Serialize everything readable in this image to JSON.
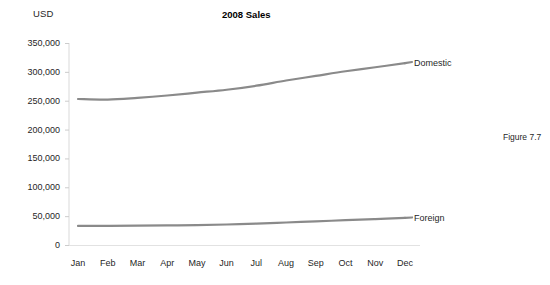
{
  "figure": {
    "caption": "Figure 7.7",
    "title": "2008 Sales",
    "unit_label": "USD"
  },
  "colors": {
    "series_line": "#8a8a8a",
    "axis": "#d9d9d9",
    "tick": "#cccccc",
    "text": "#1f1f1f",
    "background": "#ffffff"
  },
  "chart_data": {
    "type": "line",
    "title": "2008 Sales",
    "xlabel": "",
    "ylabel": "USD",
    "ylim": [
      0,
      350000
    ],
    "yticks": [
      0,
      50000,
      100000,
      150000,
      200000,
      250000,
      300000,
      350000
    ],
    "ytick_labels": [
      "0",
      "50,000",
      "100,000",
      "150,000",
      "200,000",
      "250,000",
      "300,000",
      "350,000"
    ],
    "categories": [
      "Jan",
      "Feb",
      "Mar",
      "Apr",
      "May",
      "Jun",
      "Jul",
      "Aug",
      "Sep",
      "Oct",
      "Nov",
      "Dec"
    ],
    "grid": false,
    "legend_position": "line-end-labels",
    "series": [
      {
        "name": "Domestic",
        "values": [
          253000,
          252000,
          255000,
          259000,
          264000,
          269000,
          276000,
          285000,
          293000,
          301000,
          308000,
          315000
        ]
      },
      {
        "name": "Foreign",
        "values": [
          33000,
          33000,
          33500,
          34000,
          34500,
          35500,
          37000,
          39000,
          41000,
          43000,
          45000,
          47000
        ]
      }
    ]
  }
}
